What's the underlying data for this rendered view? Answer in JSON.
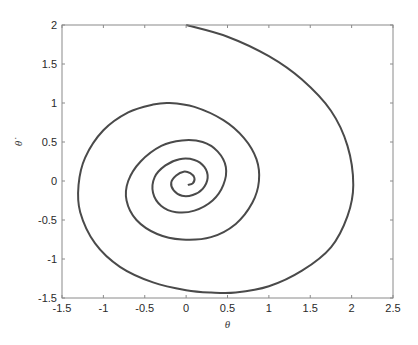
{
  "chart_data": {
    "type": "line",
    "title": "",
    "xlabel": "θ",
    "ylabel": "θ̇",
    "xlim": [
      -1.5,
      2.5
    ],
    "ylim": [
      -1.5,
      2
    ],
    "xticks": [
      -1.5,
      -1,
      -0.5,
      0,
      0.5,
      1,
      1.5,
      2,
      2.5
    ],
    "xtick_labels": [
      "-1.5",
      "-1",
      "-0.5",
      "0",
      "0.5",
      "1",
      "1.5",
      "2",
      "2.5"
    ],
    "yticks": [
      -1.5,
      -1,
      -0.5,
      0,
      0.5,
      1,
      1.5,
      2
    ],
    "ytick_labels": [
      "-1.5",
      "-1",
      "-0.5",
      "0",
      "0.5",
      "1",
      "1.5",
      "2"
    ],
    "grid": false,
    "legend": null,
    "line_color": "#4a4a4a",
    "series": [
      {
        "name": "phase trajectory",
        "x": [
          0.0,
          0.5,
          1.0,
          1.4,
          1.75,
          1.95,
          2.02,
          1.95,
          1.75,
          1.4,
          1.0,
          0.6,
          0.3,
          0.0,
          -0.4,
          -0.8,
          -1.1,
          -1.28,
          -1.3,
          -1.22,
          -1.0,
          -0.7,
          -0.4,
          -0.2,
          0.1,
          0.45,
          0.7,
          0.85,
          0.88,
          0.8,
          0.6,
          0.3,
          -0.05,
          -0.35,
          -0.6,
          -0.72,
          -0.7,
          -0.55,
          -0.3,
          -0.05,
          0.2,
          0.38,
          0.48,
          0.45,
          0.32,
          0.1,
          -0.12,
          -0.3,
          -0.4,
          -0.38,
          -0.25,
          -0.08,
          0.1,
          0.22,
          0.26,
          0.2,
          0.08,
          -0.05,
          -0.15,
          -0.18,
          -0.12,
          -0.03,
          0.05,
          0.1,
          0.08,
          0.02
        ],
        "y": [
          2.0,
          1.85,
          1.6,
          1.3,
          0.9,
          0.45,
          -0.05,
          -0.45,
          -0.85,
          -1.15,
          -1.35,
          -1.43,
          -1.43,
          -1.4,
          -1.3,
          -1.1,
          -0.8,
          -0.4,
          -0.05,
          0.3,
          0.65,
          0.88,
          0.98,
          1.0,
          0.95,
          0.78,
          0.55,
          0.28,
          0.0,
          -0.28,
          -0.55,
          -0.72,
          -0.75,
          -0.68,
          -0.5,
          -0.25,
          0.0,
          0.25,
          0.45,
          0.52,
          0.5,
          0.38,
          0.18,
          -0.05,
          -0.25,
          -0.38,
          -0.4,
          -0.32,
          -0.15,
          0.05,
          0.2,
          0.28,
          0.27,
          0.18,
          0.04,
          -0.1,
          -0.18,
          -0.19,
          -0.12,
          -0.02,
          0.07,
          0.12,
          0.1,
          0.04,
          -0.03,
          -0.05
        ]
      }
    ]
  }
}
